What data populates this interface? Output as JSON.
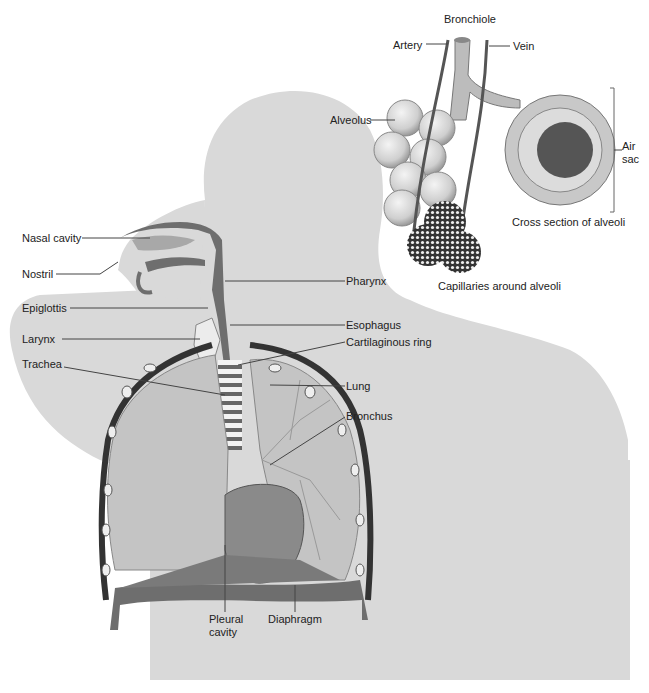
{
  "diagram": {
    "body_labels": [
      {
        "key": "nasal_cavity",
        "text": "Nasal cavity"
      },
      {
        "key": "nostril",
        "text": "Nostril"
      },
      {
        "key": "epiglottis",
        "text": "Epiglottis"
      },
      {
        "key": "larynx",
        "text": "Larynx"
      },
      {
        "key": "trachea",
        "text": "Trachea"
      },
      {
        "key": "pharynx",
        "text": "Pharynx"
      },
      {
        "key": "esophagus",
        "text": "Esophagus"
      },
      {
        "key": "cartilaginous_ring",
        "text": "Cartilaginous ring"
      },
      {
        "key": "lung",
        "text": "Lung"
      },
      {
        "key": "bronchus",
        "text": "Bronchus"
      },
      {
        "key": "pleural_cavity",
        "text": "Pleural cavity"
      },
      {
        "key": "diaphragm",
        "text": "Diaphragm"
      }
    ],
    "inset_labels": [
      {
        "key": "bronchiole",
        "text": "Bronchiole"
      },
      {
        "key": "artery",
        "text": "Artery"
      },
      {
        "key": "vein",
        "text": "Vein"
      },
      {
        "key": "alveolus",
        "text": "Alveolus"
      },
      {
        "key": "air_sac",
        "text": "Air sac"
      },
      {
        "key": "cross_section",
        "text": "Cross section of alveoli"
      },
      {
        "key": "capillaries",
        "text": "Capillaries around alveoli"
      }
    ]
  },
  "labels": {
    "nasal_cavity": "Nasal cavity",
    "nostril": "Nostril",
    "epiglottis": "Epiglottis",
    "larynx": "Larynx",
    "trachea": "Trachea",
    "pharynx": "Pharynx",
    "esophagus": "Esophagus",
    "cartilaginous_ring": "Cartilaginous ring",
    "lung": "Lung",
    "bronchus": "Bronchus",
    "pleural_1": "Pleural",
    "pleural_2": "cavity",
    "diaphragm": "Diaphragm",
    "bronchiole": "Bronchiole",
    "artery": "Artery",
    "vein": "Vein",
    "alveolus": "Alveolus",
    "air_1": "Air",
    "air_2": "sac",
    "cross_section": "Cross section of alveoli",
    "capillaries": "Capillaries around alveoli"
  },
  "colors": {
    "body_silhouette": "#d9d9d9",
    "airway_dark": "#6e6e6e",
    "lung_fill": "#c4c4c4",
    "diaphragm": "#7a7a7a",
    "alveoli": "#d4d4d4"
  }
}
